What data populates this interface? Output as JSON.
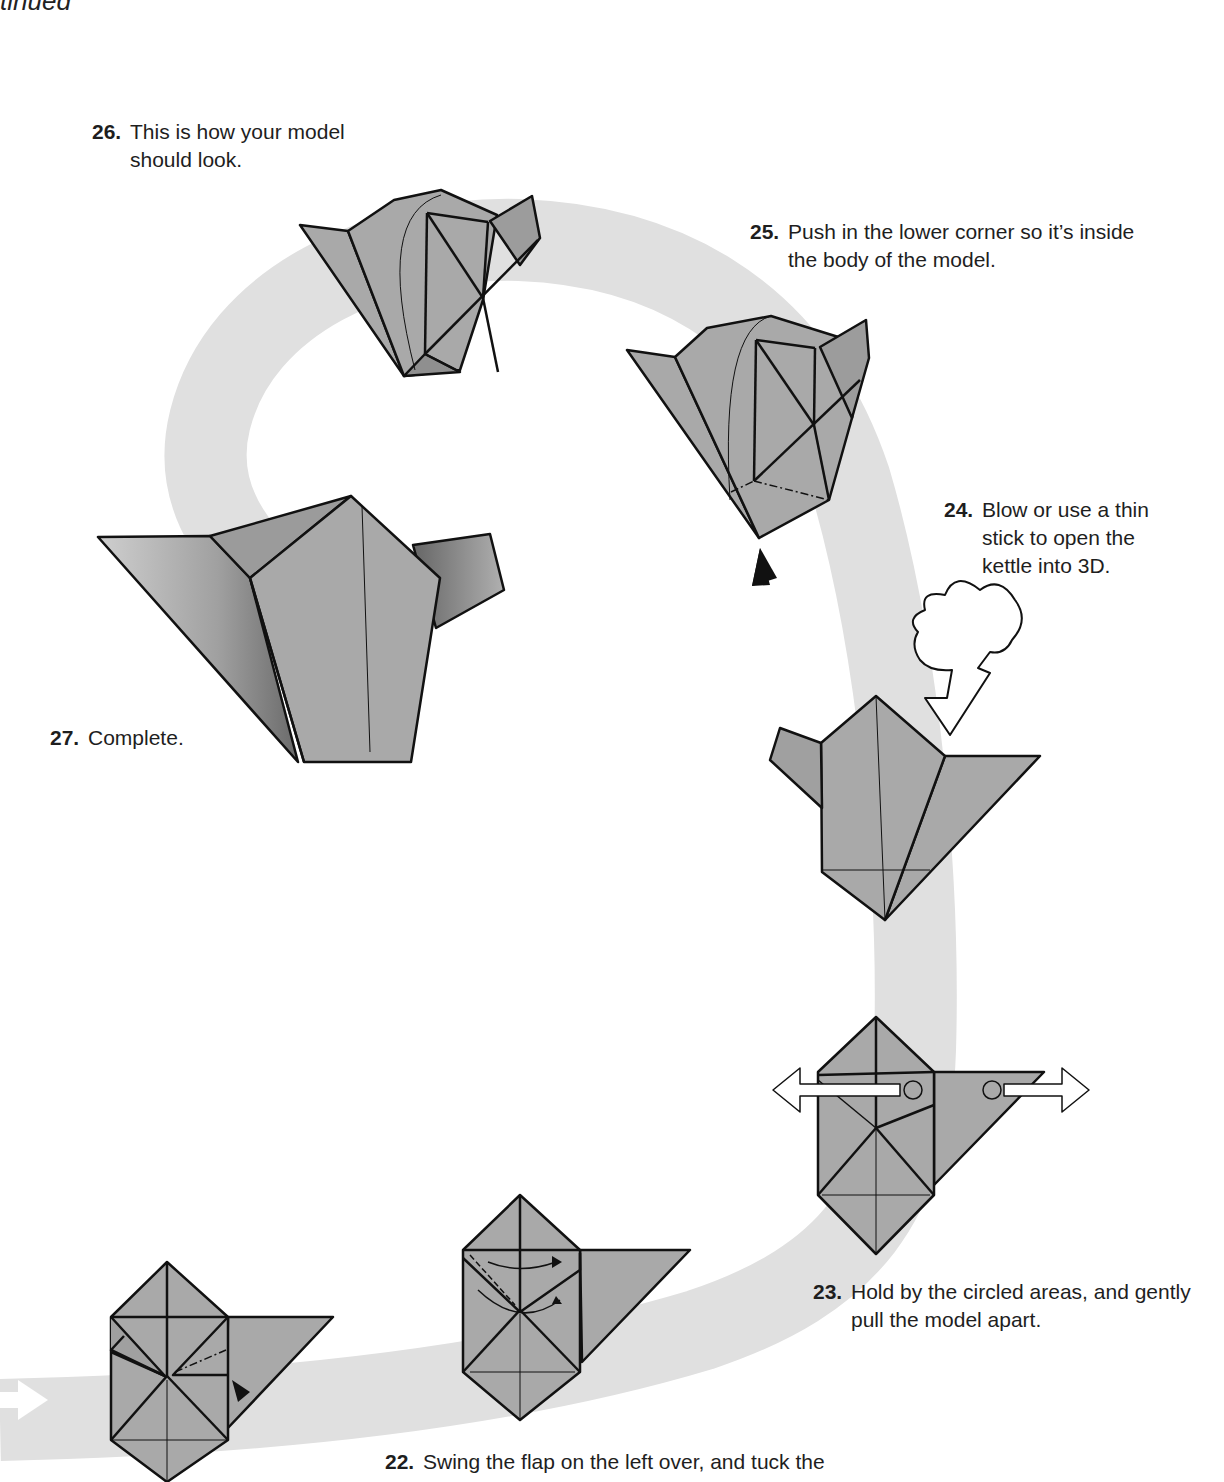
{
  "page": {
    "header_fragment": "tinued"
  },
  "steps": [
    {
      "id": 22,
      "number": "22.",
      "text": "Swing the flap on the left over, and tuck the"
    },
    {
      "id": 23,
      "number": "23.",
      "text": "Hold by the circled areas, and gently pull the model apart."
    },
    {
      "id": 24,
      "number": "24.",
      "text": "Blow or use a thin stick to open the kettle into 3D."
    },
    {
      "id": 25,
      "number": "25.",
      "text": "Push in the lower corner so it’s inside the body of the model."
    },
    {
      "id": 26,
      "number": "26.",
      "text": "This is how your model should look."
    },
    {
      "id": 27,
      "number": "27.",
      "text": "Complete."
    }
  ],
  "colors": {
    "paper": "#a9a9a9",
    "paper_dark": "#8f8f8f",
    "path": "#e0e0e0",
    "outline": "#111111",
    "background": "#ffffff"
  },
  "icons": {
    "push_arrow": "black-triangle-arrow",
    "pull_arrows": "double-hollow-arrow",
    "blow_arrow": "cloud-puff-arrow",
    "flow_arrow": "white-right-arrow"
  }
}
